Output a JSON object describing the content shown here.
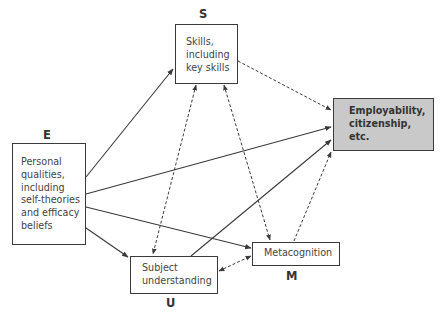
{
  "diagram": {
    "nodes": {
      "S": {
        "letter": "S",
        "text": "Skills,\nincluding\nkey skills"
      },
      "E": {
        "letter": "E",
        "text": "Personal\nqualities,\nincluding\nself-theories\nand efficacy\nbeliefs"
      },
      "O": {
        "text": "Employability,\ncitizenship, etc."
      },
      "M": {
        "letter": "M",
        "text": "Metacognition"
      },
      "U": {
        "letter": "U",
        "text": "Subject\nunderstanding"
      }
    },
    "edges": [
      {
        "from": "E",
        "to": "S",
        "style": "solid",
        "direction": "forward"
      },
      {
        "from": "E",
        "to": "O",
        "style": "solid",
        "direction": "forward"
      },
      {
        "from": "E",
        "to": "M",
        "style": "solid",
        "direction": "forward"
      },
      {
        "from": "E",
        "to": "U",
        "style": "solid",
        "direction": "forward"
      },
      {
        "from": "U",
        "to": "O",
        "style": "solid",
        "direction": "forward"
      },
      {
        "from": "S",
        "to": "O",
        "style": "dashed",
        "direction": "forward"
      },
      {
        "from": "M",
        "to": "O",
        "style": "dashed",
        "direction": "forward"
      },
      {
        "from": "S",
        "to": "U",
        "style": "dashed",
        "direction": "both"
      },
      {
        "from": "S",
        "to": "M",
        "style": "dashed",
        "direction": "both"
      },
      {
        "from": "U",
        "to": "M",
        "style": "dashed",
        "direction": "both"
      }
    ],
    "colors": {
      "outcome_fill": "#c9c9c9",
      "stroke": "#3a3a3a"
    }
  }
}
